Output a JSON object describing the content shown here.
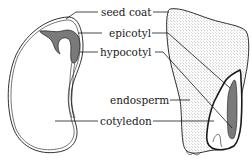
{
  "diagram": {
    "labels": {
      "seed_coat": "seed coat",
      "epicotyl": "epicotyl",
      "hypocotyl": "hypocotyl",
      "endosperm": "endosperm",
      "cotyledon": "cotyledon"
    },
    "specimens": [
      {
        "name": "bean-seed",
        "parts": [
          "seed coat",
          "epicotyl",
          "hypocotyl",
          "cotyledon"
        ]
      },
      {
        "name": "corn-seed",
        "parts": [
          "seed coat",
          "epicotyl",
          "hypocotyl",
          "endosperm",
          "cotyledon"
        ]
      }
    ],
    "colors": {
      "outline": "#1a1a1a",
      "embryo_fill": "#7a7a7a",
      "endosperm_stipple": "#8a8a8a",
      "background": "#ffffff"
    }
  }
}
